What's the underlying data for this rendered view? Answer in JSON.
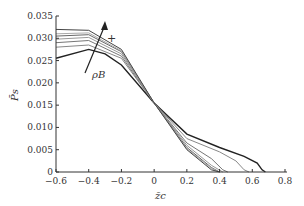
{
  "chart_data": {
    "type": "line",
    "title": "",
    "xlabel": "z̄c",
    "ylabel": "P̄s",
    "xlim": [
      -0.6,
      0.8
    ],
    "ylim": [
      0,
      0.035
    ],
    "xticks": [
      "−0.6",
      "−0.4",
      "−0.2",
      "0",
      "0.2",
      "0.4",
      "0.6",
      "0.8"
    ],
    "yticks": [
      "0",
      "0.005",
      "0.010",
      "0.015",
      "0.020",
      "0.025",
      "0.030",
      "0.035"
    ],
    "grid": false,
    "annotations": [
      {
        "text": "ρB",
        "note": "arrow indicating increasing ρB from dark curve to lighter curves"
      },
      {
        "text": "+",
        "note": "plus sign near arrow head"
      }
    ],
    "series": [
      {
        "name": "curve 1 (dark)",
        "color": "#222222",
        "x": [
          -0.6,
          -0.4,
          -0.3,
          -0.2,
          0,
          0.2,
          0.4,
          0.55,
          0.63,
          0.66,
          0.68
        ],
        "y": [
          0.0255,
          0.0275,
          0.0265,
          0.024,
          0.0155,
          0.0085,
          0.0055,
          0.0035,
          0.002,
          0.0005,
          0
        ]
      },
      {
        "name": "curve 2",
        "color": "#888888",
        "x": [
          -0.6,
          -0.4,
          -0.2,
          0,
          0.2,
          0.4,
          0.5,
          0.55,
          0.58
        ],
        "y": [
          0.028,
          0.0285,
          0.0255,
          0.0155,
          0.0075,
          0.0045,
          0.0025,
          0.0005,
          0
        ]
      },
      {
        "name": "curve 3",
        "color": "#777777",
        "x": [
          -0.6,
          -0.4,
          -0.2,
          0,
          0.2,
          0.35,
          0.42,
          0.45
        ],
        "y": [
          0.029,
          0.0295,
          0.026,
          0.0155,
          0.0065,
          0.003,
          0.0005,
          0
        ]
      },
      {
        "name": "curve 4",
        "color": "#999999",
        "x": [
          -0.6,
          -0.4,
          -0.2,
          0,
          0.2,
          0.35,
          0.42
        ],
        "y": [
          0.0298,
          0.0302,
          0.0265,
          0.0155,
          0.006,
          0.0015,
          0
        ]
      },
      {
        "name": "curve 5",
        "color": "#666666",
        "x": [
          -0.6,
          -0.4,
          -0.2,
          0,
          0.2,
          0.35,
          0.4
        ],
        "y": [
          0.0305,
          0.0308,
          0.027,
          0.0155,
          0.0055,
          0.001,
          0
        ]
      },
      {
        "name": "curve 6",
        "color": "#aaaaaa",
        "x": [
          -0.6,
          -0.4,
          -0.2,
          0,
          0.2,
          0.35,
          0.4
        ],
        "y": [
          0.031,
          0.0312,
          0.0272,
          0.0155,
          0.0052,
          0.0008,
          0
        ]
      },
      {
        "name": "curve 7 (top)",
        "color": "#444444",
        "x": [
          -0.6,
          -0.4,
          -0.2,
          0,
          0.2,
          0.35,
          0.4
        ],
        "y": [
          0.032,
          0.0318,
          0.0275,
          0.0155,
          0.005,
          0.0005,
          0
        ]
      }
    ]
  }
}
